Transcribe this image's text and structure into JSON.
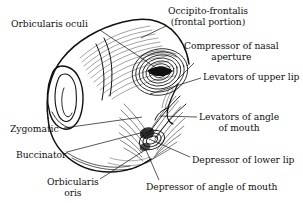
{
  "figure": {
    "view": "left oblique view of the face with superficial facial musculature",
    "style": "black-and-white engraved line art on white background",
    "line_color": "#111111",
    "background": "#ffffff"
  },
  "labels": [
    {
      "id": "orbicularis-oculi",
      "line1": "Orbicularis oculi",
      "line2": "",
      "side": "left",
      "text_x": 11,
      "text_y": 19,
      "leader": {
        "x1": 100,
        "y1": 30,
        "x2": 160,
        "y2": 70
      }
    },
    {
      "id": "occipito-frontalis",
      "line1": "Occipito-frontalis",
      "line2": "(frontal portion)",
      "side": "right",
      "text_x": 168,
      "text_y": 6,
      "leader": {
        "x1": 166,
        "y1": 26,
        "x2": 141,
        "y2": 38
      }
    },
    {
      "id": "compressor-nasal-aperture",
      "line1": "Compressor of nasal",
      "line2": "aperture",
      "side": "right",
      "text_x": 184,
      "text_y": 41,
      "leader": {
        "x1": 193,
        "y1": 64,
        "x2": 172,
        "y2": 84
      }
    },
    {
      "id": "levators-upper-lip",
      "line1": "Levators of upper lip",
      "line2": "",
      "side": "right",
      "text_x": 203,
      "text_y": 72,
      "leader": {
        "x1": 200,
        "y1": 77,
        "x2": 151,
        "y2": 94
      }
    },
    {
      "id": "levators-angle-mouth",
      "line1": "Levators of angle",
      "line2": "of mouth",
      "side": "right",
      "text_x": 199,
      "text_y": 112,
      "leader": {
        "x1": 196,
        "y1": 117,
        "x2": 162,
        "y2": 117
      }
    },
    {
      "id": "depressor-lower-lip",
      "line1": "Depressor of lower lip",
      "line2": "",
      "side": "right",
      "text_x": 192,
      "text_y": 155,
      "leader": {
        "x1": 190,
        "y1": 157,
        "x2": 150,
        "y2": 140
      }
    },
    {
      "id": "depressor-angle-mouth",
      "line1": "Depressor of angle of mouth",
      "line2": "",
      "side": "right",
      "text_x": 146,
      "text_y": 182,
      "leader": {
        "x1": 158,
        "y1": 180,
        "x2": 146,
        "y2": 150
      }
    },
    {
      "id": "zygomatic",
      "line1": "Zygomatic",
      "line2": "",
      "side": "left",
      "text_x": 10,
      "text_y": 124,
      "leader": {
        "x1": 63,
        "y1": 128,
        "x2": 141,
        "y2": 118
      }
    },
    {
      "id": "buccinator",
      "line1": "Buccinator",
      "line2": "",
      "side": "left",
      "text_x": 16,
      "text_y": 150,
      "leader": {
        "x1": 66,
        "y1": 152,
        "x2": 143,
        "y2": 133
      }
    },
    {
      "id": "orbicularis-oris",
      "line1": "Orbicularis",
      "line2": "oris",
      "side": "left",
      "text_x": 47,
      "text_y": 177,
      "leader": {
        "x1": 99,
        "y1": 179,
        "x2": 144,
        "y2": 150
      }
    }
  ],
  "structures": [
    "ear (auricle)",
    "forehead / frontalis",
    "orbital region with concentric orbicularis oculi fibres",
    "nasal region",
    "radiating perioral muscles",
    "mandible and cheek outline"
  ]
}
